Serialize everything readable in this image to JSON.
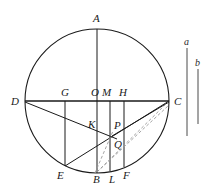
{
  "figure": {
    "width": 211,
    "height": 193,
    "background_color": "#ffffff",
    "stroke_color": "#1a1a1a",
    "dashed_stroke_color": "#9a9a9a"
  },
  "circle": {
    "center_label": "O",
    "cx": 97,
    "cy": 101,
    "r": 72,
    "stroke_color": "#1a1a1a"
  },
  "points": [
    {
      "id": "A",
      "label": "A",
      "x": 97,
      "y": 29,
      "label_x": 93,
      "label_y": 13
    },
    {
      "id": "D",
      "label": "D",
      "x": 25,
      "y": 101,
      "label_x": 11,
      "label_y": 96
    },
    {
      "id": "C",
      "label": "C",
      "x": 169,
      "y": 101,
      "label_x": 174,
      "label_y": 96
    },
    {
      "id": "G",
      "label": "G",
      "x": 65,
      "y": 101,
      "label_x": 61,
      "label_y": 87
    },
    {
      "id": "O",
      "label": "O",
      "x": 97,
      "y": 101,
      "label_x": 91,
      "label_y": 87
    },
    {
      "id": "M",
      "label": "M",
      "x": 110,
      "y": 101,
      "label_x": 103,
      "label_y": 87
    },
    {
      "id": "H",
      "label": "H",
      "x": 124,
      "y": 101,
      "label_x": 120,
      "label_y": 87
    },
    {
      "id": "K",
      "label": "K",
      "x": 97,
      "y": 127,
      "label_x": 88,
      "label_y": 119
    },
    {
      "id": "P",
      "label": "P",
      "x": 110,
      "y": 128,
      "label_x": 114,
      "label_y": 120
    },
    {
      "id": "Q",
      "label": "Q",
      "x": 110,
      "y": 144,
      "label_x": 114,
      "label_y": 140
    },
    {
      "id": "E",
      "label": "E",
      "x": 65,
      "y": 166,
      "label_x": 58,
      "label_y": 170
    },
    {
      "id": "B",
      "label": "B",
      "x": 97,
      "y": 173,
      "label_x": 93,
      "label_y": 174
    },
    {
      "id": "L",
      "label": "L",
      "x": 110,
      "y": 171,
      "label_x": 110,
      "label_y": 174
    },
    {
      "id": "F",
      "label": "F",
      "x": 124,
      "y": 167,
      "label_x": 124,
      "label_y": 170
    }
  ],
  "solid_lines": [
    {
      "name": "vertical-diameter-AB",
      "x1": 97,
      "y1": 29,
      "x2": 97,
      "y2": 173
    },
    {
      "name": "horizontal-diameter-DC",
      "x1": 25,
      "y1": 101,
      "x2": 169,
      "y2": 101
    },
    {
      "name": "chord-G-E",
      "x1": 65,
      "y1": 101,
      "x2": 65,
      "y2": 166
    },
    {
      "name": "chord-M-L",
      "x1": 110,
      "y1": 101,
      "x2": 110,
      "y2": 171
    },
    {
      "name": "chord-H-F",
      "x1": 124,
      "y1": 101,
      "x2": 124,
      "y2": 167
    },
    {
      "name": "line-D-to-C-lower",
      "x1": 25,
      "y1": 101,
      "x2": 169,
      "y2": 101
    },
    {
      "name": "segment-D-K-P-C",
      "x1": 25,
      "y1": 103,
      "x2": 169,
      "y2": 101
    },
    {
      "name": "segment-D-to-Q",
      "x1": 25,
      "y1": 103,
      "x2": 117,
      "y2": 139
    },
    {
      "name": "segment-E-to-C",
      "x1": 65,
      "y1": 166,
      "x2": 169,
      "y2": 101
    },
    {
      "name": "segment-D-down-to-E-region",
      "x1": 25,
      "y1": 102,
      "x2": 116,
      "y2": 138
    }
  ],
  "dashed_lines": [
    {
      "name": "dashed-B-to-C-upper",
      "x1": 97,
      "y1": 172,
      "x2": 168,
      "y2": 102
    },
    {
      "name": "dashed-B-to-C-lower",
      "x1": 97,
      "y1": 172,
      "x2": 168,
      "y2": 105
    },
    {
      "name": "dashed-B-to-Q",
      "x1": 95,
      "y1": 172,
      "x2": 112,
      "y2": 133
    }
  ],
  "reference_segments": [
    {
      "id": "a",
      "label": "a",
      "x": 187,
      "y1": 48,
      "y2": 136,
      "label_x": 184,
      "label_y": 37
    },
    {
      "id": "b",
      "label": "b",
      "x": 198,
      "y1": 69,
      "y2": 124,
      "label_x": 195,
      "label_y": 58
    }
  ]
}
